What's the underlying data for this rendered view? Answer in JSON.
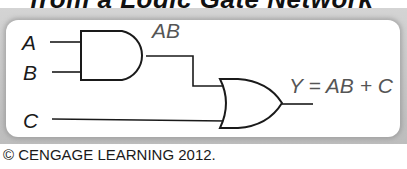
{
  "title": "from a Logic Gate Network",
  "diagram": {
    "inputs": [
      {
        "label": "A"
      },
      {
        "label": "B"
      },
      {
        "label": "C"
      }
    ],
    "gates": [
      {
        "type": "AND",
        "inputs": [
          "A",
          "B"
        ],
        "output_label": "AB"
      },
      {
        "type": "OR",
        "inputs": [
          "AB",
          "C"
        ],
        "output_label": "Y = AB + C"
      }
    ],
    "intermediate_label": "AB",
    "output_expression": "Y = AB + C"
  },
  "copyright": "© CENGAGE LEARNING 2012."
}
